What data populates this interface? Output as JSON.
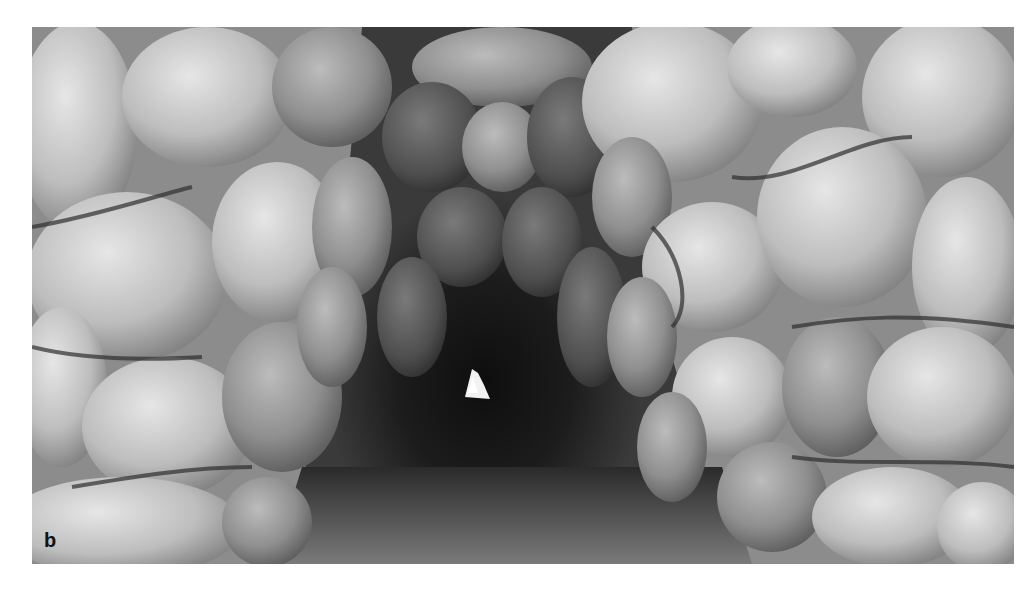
{
  "figure": {
    "panel_label": "b",
    "tone": "grayscale",
    "colors": {
      "background": "#ffffff",
      "stone_light": "#d9d9d9",
      "stone_mid": "#a8a8a8",
      "stone_shadow": "#5a5a5a",
      "tunnel_dark": "#1a1a1a",
      "far_opening": "#f4f4f4",
      "floor": "#6e6e6e",
      "label": "#111111"
    }
  }
}
